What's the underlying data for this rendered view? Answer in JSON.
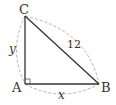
{
  "diagram": {
    "type": "right-triangle",
    "vertices": {
      "A": {
        "label": "A",
        "x": 25,
        "y": 84
      },
      "B": {
        "label": "B",
        "x": 99,
        "y": 84
      },
      "C": {
        "label": "C",
        "x": 25,
        "y": 16
      }
    },
    "right_angle_at": "A",
    "sides": {
      "CB": {
        "label": "12"
      },
      "AC": {
        "label": "y"
      },
      "AB": {
        "label": "x"
      }
    },
    "colors": {
      "line": "#333333",
      "dashed_arc": "#aaaaaa"
    }
  }
}
